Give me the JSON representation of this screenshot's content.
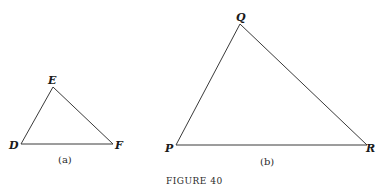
{
  "figure": {
    "caption": "Figure 40",
    "caption_display": "FIGURE 40"
  },
  "triangles": [
    {
      "id": "a",
      "sublabel": "(a)",
      "vertices": [
        {
          "name": "D",
          "x": 21,
          "y": 144,
          "label_x": 9,
          "label_y": 149
        },
        {
          "name": "E",
          "x": 53,
          "y": 87,
          "label_x": 48,
          "label_y": 84
        },
        {
          "name": "F",
          "x": 113,
          "y": 144,
          "label_x": 115,
          "label_y": 149
        }
      ],
      "sublabel_x": 58,
      "sublabel_y": 163
    },
    {
      "id": "b",
      "sublabel": "(b)",
      "vertices": [
        {
          "name": "P",
          "x": 176,
          "y": 145,
          "label_x": 165,
          "label_y": 152
        },
        {
          "name": "Q",
          "x": 240,
          "y": 24,
          "label_x": 236,
          "label_y": 21
        },
        {
          "name": "R",
          "x": 367,
          "y": 145,
          "label_x": 366,
          "label_y": 152
        }
      ],
      "sublabel_x": 260,
      "sublabel_y": 165
    }
  ],
  "colors": {
    "line": "#3a3a3a",
    "text": "#1a1a1a",
    "background": "#ffffff"
  }
}
